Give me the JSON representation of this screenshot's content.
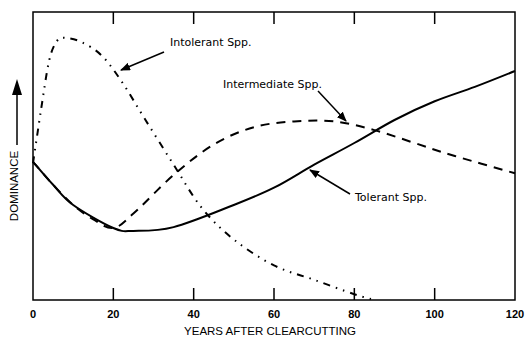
{
  "chart_data": {
    "type": "line",
    "title": "",
    "xlabel": "YEARS AFTER CLEARCUTTING",
    "ylabel": "DOMINANCE",
    "xlim": [
      0,
      120
    ],
    "ylim": [
      0,
      100
    ],
    "xticks": [
      0,
      20,
      40,
      60,
      80,
      100,
      120
    ],
    "xtick_labels": [
      "0",
      "20",
      "40",
      "60",
      "80",
      "100",
      "120"
    ],
    "yticks": [],
    "grid": false,
    "legend": "none (curves labeled with arrow annotations)",
    "series": [
      {
        "name": "Intolerant Spp.",
        "style": "dash-dot-dot",
        "x": [
          0,
          2,
          4,
          6,
          8,
          12,
          17,
          22,
          28,
          35,
          42,
          50,
          60,
          70,
          80,
          85
        ],
        "values": [
          47.5,
          66,
          83,
          90,
          91,
          89.6,
          85,
          76,
          62.5,
          47,
          32,
          21,
          12,
          7,
          2,
          0
        ]
      },
      {
        "name": "Intermediate Spp.",
        "style": "dashed",
        "x": [
          0,
          5,
          10,
          15,
          20,
          25,
          35,
          45,
          55,
          65,
          75,
          85,
          95,
          105,
          120
        ],
        "values": [
          48,
          40,
          33,
          28,
          25,
          30,
          43.4,
          54,
          60,
          62,
          62,
          59,
          54.5,
          50,
          44
        ]
      },
      {
        "name": "Tolerant Spp.",
        "style": "solid",
        "x": [
          0,
          5,
          10,
          20,
          25,
          35,
          50,
          60,
          70,
          80,
          90,
          100,
          110,
          120
        ],
        "values": [
          48,
          40,
          33,
          25,
          24,
          25.3,
          33,
          39,
          47,
          54.5,
          62.5,
          69,
          74,
          79.5
        ]
      }
    ],
    "annotations": [
      {
        "text": "Intolerant Spp.",
        "points_to_x": 21,
        "points_to_y": 76
      },
      {
        "text": "Intermediate Spp.",
        "points_to_x": 77,
        "points_to_y": 62
      },
      {
        "text": "Tolerant Spp.",
        "points_to_x": 68,
        "points_to_y": 45
      }
    ],
    "y_axis_arrow": "up"
  },
  "labels": {
    "x_axis_title": "YEARS AFTER CLEARCUTTING",
    "y_axis_title": "DOMINANCE",
    "intolerant": "Intolerant Spp.",
    "intermediate": "Intermediate Spp.",
    "tolerant": "Tolerant Spp.",
    "xticks": [
      "0",
      "20",
      "40",
      "60",
      "80",
      "100",
      "120"
    ]
  }
}
